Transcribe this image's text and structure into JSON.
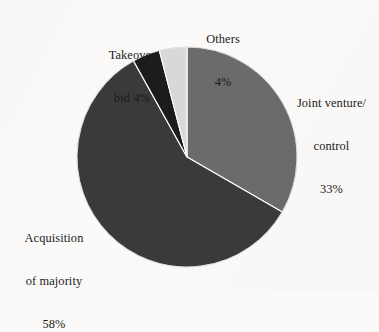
{
  "figure": {
    "background_color": "#fbfaf8",
    "text_color": "#1a1a1a"
  },
  "chart_data": {
    "type": "pie",
    "title": "",
    "subtitle": "",
    "xlabel": "",
    "ylabel": "",
    "legend_position": "none",
    "grid": false,
    "labels_position": "outside",
    "start_angle_deg": 0,
    "direction": "clockwise",
    "center": {
      "x": 187,
      "y": 157
    },
    "radius": 110,
    "categories": [
      "Joint venture/ control",
      "Acquisition of majority",
      "Takeover bid",
      "Others"
    ],
    "values": [
      33,
      58,
      4,
      4
    ],
    "unit": "%",
    "slices": [
      {
        "name": "Joint venture/ control",
        "value": 33,
        "value_label": "33%",
        "color": "#6b6b6b",
        "label_lines": [
          "Joint venture/",
          "control",
          "33%"
        ]
      },
      {
        "name": "Acquisition of majority",
        "value": 58,
        "value_label": "58%",
        "color": "#3a3a38",
        "label_lines": [
          "Acquisition",
          "of majority",
          "58%"
        ]
      },
      {
        "name": "Takeover bid",
        "value": 4,
        "value_label": "4%",
        "color": "#1e1c1a",
        "label_lines": [
          "Takeover",
          "bid 4%"
        ]
      },
      {
        "name": "Others",
        "value": 4,
        "value_label": "4%",
        "color": "#d8d8d6",
        "label_lines": [
          "Others",
          "4%"
        ]
      }
    ]
  },
  "labels": {
    "others": {
      "line1": "Others",
      "line2": "4%"
    },
    "takeover": {
      "line1": "Takeover",
      "line2": "bid 4%"
    },
    "joint_venture": {
      "line1": "Joint venture/",
      "line2": "control",
      "line3": "33%"
    },
    "acquisition": {
      "line1": "Acquisition",
      "line2": "of majority",
      "line3": "58%"
    }
  }
}
